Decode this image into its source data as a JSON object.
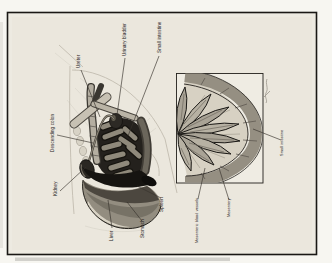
{
  "figure": {
    "labels": {
      "descending_colon": "Descending colon",
      "ureter": "Ureter",
      "urinary_bladder": "Urinary bladder",
      "small_intestine": "Small intestine",
      "kidney": "Kidney",
      "liver": "Liver",
      "stomach": "Stomach",
      "spleen": "Spleen"
    },
    "inset_labels": {
      "mesenteric_blood_vessels": "Mesenteric blood vessels",
      "mesentery": "Mesentery",
      "small_intestine": "Small intestine"
    },
    "colors": {
      "page_margin": "#f7f6f1",
      "paper": "#edeae1",
      "inset_paper": "#efece3",
      "frame_border": "#1a1815",
      "ink": "#1b1916",
      "organ_dark": "#161411",
      "organ_mid": "#8f897b",
      "sketch": "#bcb6aa"
    }
  }
}
